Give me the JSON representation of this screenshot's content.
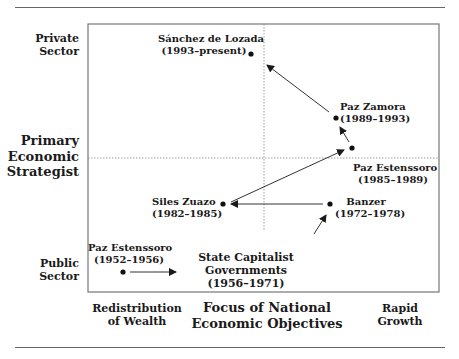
{
  "figure": {
    "caption_fragment": "Fig"
  },
  "y_axis": {
    "top_label": [
      "Private",
      "Sector"
    ],
    "middle_label": [
      "Primary",
      "Economic",
      "Strategist"
    ],
    "bottom_label": [
      "Public",
      "Sector"
    ]
  },
  "x_axis": {
    "left_label": [
      "Redistribution",
      "of Wealth"
    ],
    "middle_label": [
      "Focus of National",
      "Economic Objectives"
    ],
    "right_label": [
      "Rapid",
      "Growth"
    ]
  },
  "points": [
    {
      "name": "Paz Estenssoro",
      "period": "(1952–1956)",
      "x": 123,
      "y": 272
    },
    {
      "name": "State Capitalist Governments",
      "period": "(1956–1971)",
      "label_lines": [
        "State Capitalist",
        "Governments",
        "(1956–1971)"
      ]
    },
    {
      "name": "Banzer",
      "period": "(1972–1978)",
      "x": 330,
      "y": 204
    },
    {
      "name": "Siles Zuazo",
      "period": "(1982–1985)",
      "x": 223,
      "y": 204
    },
    {
      "name": "Paz Estenssoro",
      "period": "(1985–1989)",
      "x": 352,
      "y": 148
    },
    {
      "name": "Paz Zamora",
      "period": "(1989–1993)",
      "x": 336,
      "y": 118
    },
    {
      "name": "Sánchez de Lozada",
      "period": "(1993–present)",
      "x": 251,
      "y": 54
    }
  ],
  "arrows": [
    {
      "from": "Paz Estenssoro 1952",
      "to": "State Capitalist Governments"
    },
    {
      "from": "State Capitalist Governments",
      "to": "Banzer"
    },
    {
      "from": "Banzer",
      "to": "Siles Zuazo"
    },
    {
      "from": "Siles Zuazo",
      "to": "Paz Estenssoro 1985"
    },
    {
      "from": "Paz Estenssoro 1985",
      "to": "Paz Zamora"
    },
    {
      "from": "Paz Zamora",
      "to": "Sánchez de Lozada"
    }
  ],
  "colors": {
    "frame": "#777777",
    "dotted": "#888888",
    "ink": "#1a1a1a"
  }
}
